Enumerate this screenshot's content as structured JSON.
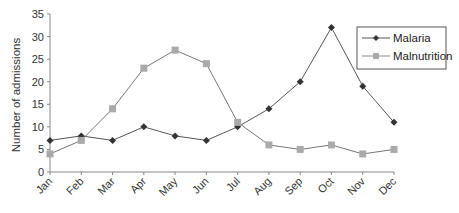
{
  "chart_data": {
    "type": "line",
    "title": "",
    "xlabel": "",
    "ylabel": "Number of admissions",
    "categories": [
      "Jan",
      "Feb",
      "Mar",
      "Apr",
      "May",
      "Jun",
      "Jul",
      "Aug",
      "Sep",
      "Oct",
      "Nov",
      "Dec"
    ],
    "series": [
      {
        "name": "Malaria",
        "marker": "diamond",
        "color": "#333333",
        "values": [
          7,
          8,
          7,
          10,
          8,
          7,
          10,
          14,
          20,
          32,
          19,
          11
        ]
      },
      {
        "name": "Malnutrition",
        "marker": "square",
        "color": "#aaaaaa",
        "values": [
          4,
          7,
          14,
          23,
          27,
          24,
          11,
          6,
          5,
          6,
          4,
          5
        ]
      }
    ],
    "ylim": [
      0,
      35
    ],
    "yticks": [
      0,
      5,
      10,
      15,
      20,
      25,
      30,
      35
    ],
    "grid": false,
    "legend_position": "upper right"
  },
  "legend": {
    "items": [
      {
        "label": "Malaria"
      },
      {
        "label": "Malnutrition"
      }
    ]
  }
}
